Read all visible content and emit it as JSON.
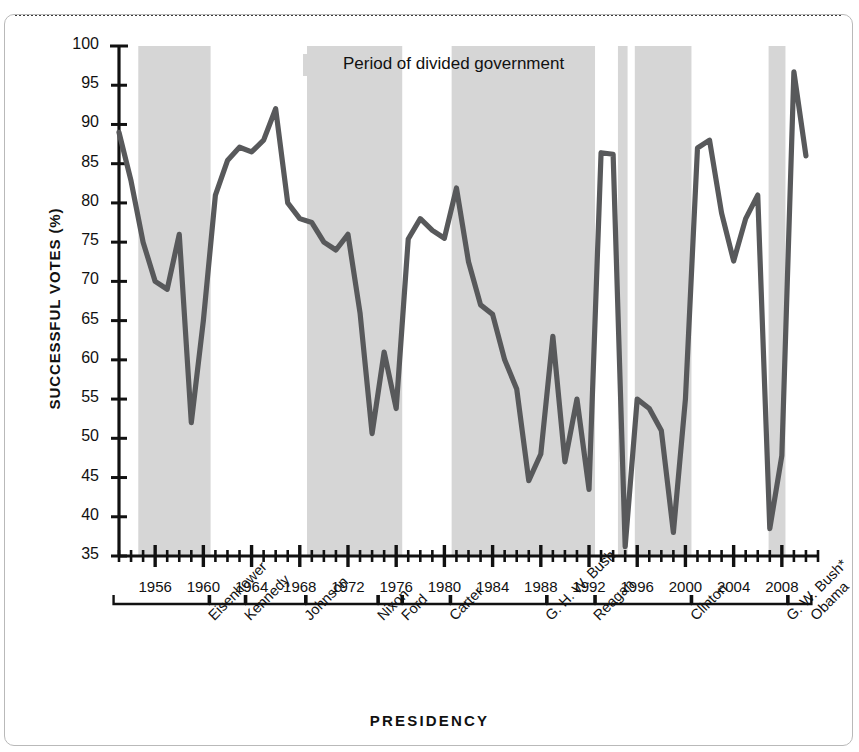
{
  "chart_data": {
    "type": "line",
    "title": "",
    "xlabel": "PRESIDENCY",
    "ylabel": "SUCCESSFUL VOTES (%)",
    "ylim": [
      35,
      100
    ],
    "xlim": [
      1953,
      2011
    ],
    "grid": false,
    "yticks": [
      35,
      40,
      45,
      50,
      55,
      60,
      65,
      70,
      75,
      80,
      85,
      90,
      95,
      100
    ],
    "xticks": [
      1956,
      1960,
      1964,
      1968,
      1972,
      1976,
      1980,
      1984,
      1988,
      1992,
      1996,
      2000,
      2004,
      2008
    ],
    "xtick_minor_step": 1,
    "legend": [
      {
        "label": "Period of divided government",
        "color": "#d6d6d6",
        "type": "shaded-band"
      }
    ],
    "series": [
      {
        "name": "Successful votes",
        "color": "#58595b",
        "x": [
          1953,
          1954,
          1955,
          1956,
          1957,
          1958,
          1959,
          1960,
          1961,
          1962,
          1963,
          1964,
          1965,
          1966,
          1967,
          1968,
          1969,
          1970,
          1971,
          1972,
          1973,
          1974,
          1975,
          1976,
          1977,
          1978,
          1979,
          1980,
          1981,
          1982,
          1983,
          1984,
          1985,
          1986,
          1987,
          1988,
          1989,
          1990,
          1991,
          1992,
          1993,
          1994,
          1995,
          1996,
          1997,
          1998,
          1999,
          2000,
          2001,
          2002,
          2003,
          2004,
          2005,
          2006,
          2007,
          2008,
          2009,
          2010
        ],
        "values": [
          89.0,
          82.8,
          75.0,
          70.0,
          69.0,
          76.0,
          52.0,
          65.0,
          81.0,
          85.4,
          87.1,
          86.5,
          88.0,
          92.0,
          80.0,
          78.0,
          77.5,
          75.0,
          74.0,
          76.0,
          66.0,
          50.6,
          61.0,
          53.8,
          75.4,
          78.0,
          76.5,
          75.5,
          81.9,
          72.5,
          67.0,
          65.8,
          60.0,
          56.3,
          44.6,
          48.0,
          63.0,
          47.0,
          55.0,
          43.5,
          86.4,
          86.2,
          36.2,
          55.0,
          53.8,
          51.0,
          38.0,
          55.0,
          87.0,
          88.0,
          78.7,
          72.6,
          78.0,
          81.0,
          38.5,
          47.8,
          96.7,
          86.0
        ]
      }
    ],
    "shaded_bands": [
      {
        "label": "divided government",
        "start": 1954.6,
        "end": 1960.6
      },
      {
        "label": "divided government",
        "start": 1968.6,
        "end": 1976.5
      },
      {
        "label": "divided government",
        "start": 1980.6,
        "end": 1992.5
      },
      {
        "label": "divided government",
        "start": 1994.4,
        "end": 1995.2
      },
      {
        "label": "divided government",
        "start": 1995.8,
        "end": 2000.5
      },
      {
        "label": "divided government",
        "start": 2006.9,
        "end": 2008.3
      }
    ],
    "presidencies": [
      {
        "name": "Eisenhower",
        "start": 1953,
        "end": 1960
      },
      {
        "name": "Kennedy",
        "start": 1961,
        "end": 1963
      },
      {
        "name": "Johnson",
        "start": 1964,
        "end": 1968
      },
      {
        "name": "Nixon",
        "start": 1969,
        "end": 1974
      },
      {
        "name": "Ford",
        "start": 1975,
        "end": 1976
      },
      {
        "name": "Carter",
        "start": 1977,
        "end": 1980
      },
      {
        "name": "G. H. W. Bush",
        "start": 1981,
        "end": 1988
      },
      {
        "name": "Reagan",
        "start": 1989,
        "end": 1992
      },
      {
        "name": "Clinton",
        "start": 1993,
        "end": 2000
      },
      {
        "name": "G. W. Bush*",
        "start": 2001,
        "end": 2008
      },
      {
        "name": "Obama",
        "start": 2009,
        "end": 2010
      }
    ]
  },
  "colors": {
    "line": "#58595b",
    "band": "#d6d6d6",
    "axis": "#111111",
    "frame": "#b9b9b9",
    "background": "#ffffff"
  },
  "legend": {
    "swatch_label": "Period of divided government"
  },
  "axes": {
    "y_title": "SUCCESSFUL VOTES (%)",
    "x_title": "PRESIDENCY"
  }
}
